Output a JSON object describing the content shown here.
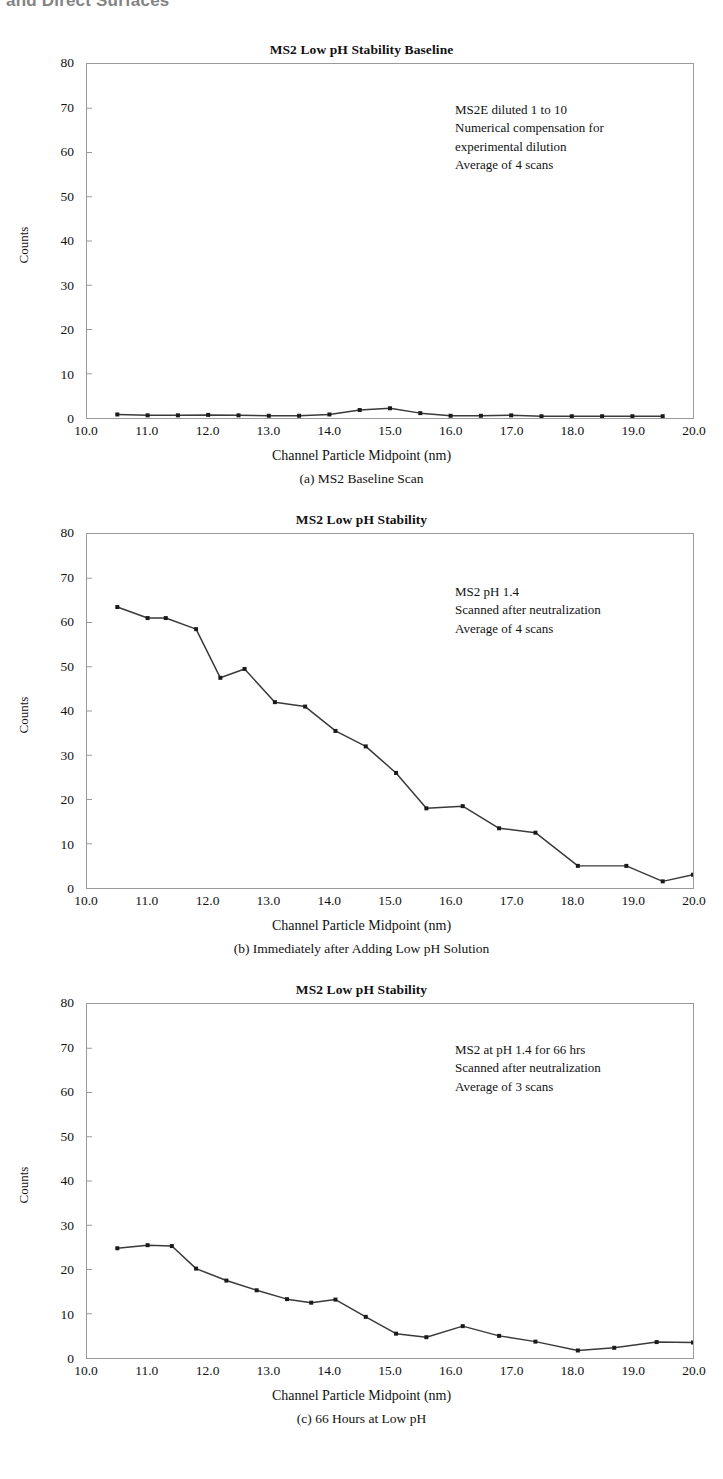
{
  "page": {
    "top_clipped_text": "and Direct Surfaces"
  },
  "axis": {
    "ylabel": "Counts",
    "xlabel": "Channel Particle Midpoint (nm)",
    "yticks": [
      0,
      10,
      20,
      30,
      40,
      50,
      60,
      70,
      80
    ],
    "xticks": [
      "10.0",
      "11.0",
      "12.0",
      "13.0",
      "14.0",
      "15.0",
      "16.0",
      "17.0",
      "18.0",
      "19.0",
      "20.0"
    ],
    "ylim": [
      0,
      80
    ],
    "xlim": [
      10.0,
      20.0
    ]
  },
  "colors": {
    "line": "#3a3a3a",
    "marker": "#1a1a1a",
    "frame": "#9a9a9a",
    "text": "#111111"
  },
  "charts": [
    {
      "key": "a",
      "title": "MS2 Low pH Stability Baseline",
      "caption": "(a) MS2 Baseline Scan",
      "annotation": "MS2E diluted 1 to 10\nNumerical compensation for\nexperimental dilution\nAverage of 4 scans"
    },
    {
      "key": "b",
      "title": "MS2 Low pH Stability",
      "caption": "(b) Immediately after Adding Low pH Solution",
      "annotation": "MS2 pH 1.4\nScanned after neutralization\nAverage of 4 scans"
    },
    {
      "key": "c",
      "title": "MS2 Low pH Stability",
      "caption": "(c) 66 Hours at Low pH",
      "annotation": "MS2 at pH 1.4 for 66 hrs\nScanned after neutralization\nAverage of 3 scans"
    }
  ],
  "chart_data": [
    {
      "type": "line",
      "id": "a",
      "title": "MS2 Low pH Stability Baseline",
      "subtitle": "(a) MS2 Baseline Scan",
      "xlabel": "Channel Particle Midpoint (nm)",
      "ylabel": "Counts",
      "xlim": [
        10.0,
        20.0
      ],
      "ylim": [
        0,
        80
      ],
      "grid": false,
      "legend": null,
      "annotations": [
        "MS2E diluted 1 to 10",
        "Numerical compensation for",
        "experimental dilution",
        "Average of 4 scans"
      ],
      "x": [
        10.5,
        11.0,
        11.5,
        12.0,
        12.5,
        13.0,
        13.5,
        14.0,
        14.5,
        15.0,
        15.5,
        16.0,
        16.5,
        17.0,
        17.5,
        18.0,
        18.5,
        19.0,
        19.5
      ],
      "y": [
        0.8,
        0.6,
        0.6,
        0.7,
        0.6,
        0.5,
        0.5,
        0.8,
        1.8,
        2.2,
        1.1,
        0.5,
        0.5,
        0.6,
        0.4,
        0.4,
        0.4,
        0.4,
        0.4
      ]
    },
    {
      "type": "line",
      "id": "b",
      "title": "MS2 Low pH Stability",
      "subtitle": "(b) Immediately after Adding Low pH Solution",
      "xlabel": "Channel Particle Midpoint (nm)",
      "ylabel": "Counts",
      "xlim": [
        10.0,
        20.0
      ],
      "ylim": [
        0,
        80
      ],
      "grid": false,
      "legend": null,
      "annotations": [
        "MS2 pH 1.4",
        "Scanned after neutralization",
        "Average of 4 scans"
      ],
      "x": [
        10.5,
        11.0,
        11.3,
        11.8,
        12.2,
        12.6,
        13.1,
        13.6,
        14.1,
        14.6,
        15.1,
        15.6,
        16.2,
        16.8,
        17.4,
        18.1,
        18.9,
        19.5,
        20.0
      ],
      "y": [
        63.5,
        61.0,
        61.0,
        58.5,
        47.5,
        49.5,
        42.0,
        41.0,
        35.5,
        32.0,
        26.0,
        18.0,
        18.5,
        13.5,
        12.5,
        5.0,
        5.0,
        1.5,
        3.0
      ]
    },
    {
      "type": "line",
      "id": "c",
      "title": "MS2 Low pH Stability",
      "subtitle": "(c) 66 Hours at Low pH",
      "xlabel": "Channel Particle Midpoint (nm)",
      "ylabel": "Counts",
      "xlim": [
        10.0,
        20.0
      ],
      "ylim": [
        0,
        80
      ],
      "grid": false,
      "legend": null,
      "annotations": [
        "MS2 at pH 1.4 for 66 hrs",
        "Scanned after neutralization",
        "Average of 3 scans"
      ],
      "x": [
        10.5,
        11.0,
        11.4,
        11.8,
        12.3,
        12.8,
        13.3,
        13.7,
        14.1,
        14.6,
        15.1,
        15.6,
        16.2,
        16.8,
        17.4,
        18.1,
        18.7,
        19.4,
        20.0
      ],
      "y": [
        24.8,
        25.5,
        25.3,
        20.2,
        17.5,
        15.3,
        13.3,
        12.5,
        13.2,
        9.3,
        5.5,
        4.7,
        7.2,
        5.0,
        3.7,
        1.7,
        2.3,
        3.6,
        3.5
      ]
    }
  ]
}
